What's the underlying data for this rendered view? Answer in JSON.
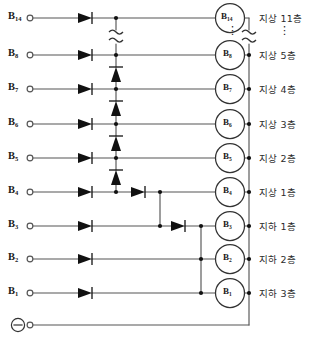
{
  "diagram": {
    "stroke_color": "#555555",
    "ink_color": "#1a1a1a",
    "negative_terminal_symbol": "⊖",
    "break_symbol": "≈",
    "vertical_ellipsis": "⋮",
    "rows": [
      {
        "terminal": "B",
        "sub": "14",
        "circle": "B",
        "circle_sub": "14",
        "floor": "지상 11층",
        "y": 18
      },
      {
        "terminal": "B",
        "sub": "8",
        "circle": "B",
        "circle_sub": "8",
        "floor": "지상 5층",
        "y": 55
      },
      {
        "terminal": "B",
        "sub": "7",
        "circle": "B",
        "circle_sub": "7",
        "floor": "지상 4층",
        "y": 89
      },
      {
        "terminal": "B",
        "sub": "6",
        "circle": "B",
        "circle_sub": "6",
        "floor": "지상 3층",
        "y": 124
      },
      {
        "terminal": "B",
        "sub": "5",
        "circle": "B",
        "circle_sub": "5",
        "floor": "지상 2층",
        "y": 158
      },
      {
        "terminal": "B",
        "sub": "4",
        "circle": "B",
        "circle_sub": "4",
        "floor": "지상 1층",
        "y": 192
      },
      {
        "terminal": "B",
        "sub": "3",
        "circle": "B",
        "circle_sub": "3",
        "floor": "지하 1층",
        "y": 226
      },
      {
        "terminal": "B",
        "sub": "2",
        "circle": "B",
        "circle_sub": "2",
        "floor": "지하 2층",
        "y": 259
      },
      {
        "terminal": "B",
        "sub": "1",
        "circle": "B",
        "circle_sub": "1",
        "floor": "지하 3층",
        "y": 293
      }
    ],
    "ground_row": {
      "terminal_symbol": "⊖",
      "y": 325
    }
  }
}
